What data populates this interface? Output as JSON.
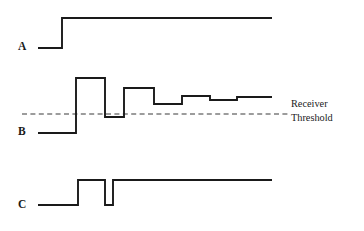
{
  "figure": {
    "type": "timing-waveform-diagram",
    "width": 364,
    "height": 231,
    "background_color": "#ffffff",
    "trace_color": "#1a1a1a",
    "threshold_color": "#3a3a3a"
  },
  "labels": {
    "signal_a": "A",
    "signal_b": "B",
    "signal_c": "C",
    "threshold_line_1": "Receiver",
    "threshold_line_2": "Threshold"
  },
  "chart_data": {
    "type": "line",
    "title": "",
    "xlabel": "",
    "ylabel": "",
    "grid": false,
    "legend": "none",
    "xlim": [
      0,
      364
    ],
    "ylim": [
      231,
      0
    ],
    "annotations": [
      {
        "name": "receiver-threshold",
        "text": "Receiver Threshold",
        "style": "dashed horizontal reference line",
        "y": 114,
        "x_start": 22,
        "x_end": 288,
        "label_x": 291,
        "label_y": 103
      }
    ],
    "series": [
      {
        "name": "A",
        "description": "Transmitted signal: single clean rising edge to steady high level",
        "label_x": 18,
        "label_y": 41,
        "low_level": 48,
        "high_level": 18,
        "points": [
          [
            38,
            48
          ],
          [
            62,
            48
          ],
          [
            62,
            18
          ],
          [
            272,
            18
          ]
        ]
      },
      {
        "name": "B",
        "description": "Received signal with ringing/overshoot: large overshoot pulse above threshold, then decaying oscillation settling above the receiver threshold",
        "label_x": 18,
        "label_y": 126,
        "baseline_level": 133,
        "points": [
          [
            38,
            133
          ],
          [
            76,
            133
          ],
          [
            76,
            78
          ],
          [
            105,
            78
          ],
          [
            105,
            117
          ],
          [
            124,
            117
          ],
          [
            124,
            88
          ],
          [
            154,
            88
          ],
          [
            154,
            104
          ],
          [
            182,
            104
          ],
          [
            182,
            96
          ],
          [
            210,
            96
          ],
          [
            210,
            100
          ],
          [
            237,
            100
          ],
          [
            237,
            97
          ],
          [
            272,
            97
          ]
        ]
      },
      {
        "name": "C",
        "description": "Recovered logic output: spurious narrow glitch pulse followed by steady high level",
        "label_x": 18,
        "label_y": 199,
        "low_level": 205,
        "high_level": 180,
        "points": [
          [
            38,
            205
          ],
          [
            78,
            205
          ],
          [
            78,
            180
          ],
          [
            105,
            180
          ],
          [
            105,
            205
          ],
          [
            113,
            205
          ],
          [
            113,
            180
          ],
          [
            272,
            180
          ]
        ]
      }
    ]
  }
}
